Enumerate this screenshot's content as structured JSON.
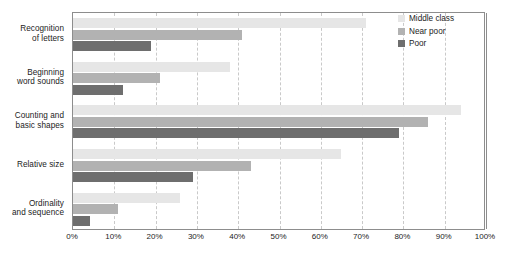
{
  "chart_data": {
    "type": "bar",
    "orientation": "horizontal",
    "title": "",
    "subtitle": "",
    "xlabel": "",
    "ylabel": "",
    "xlim": [
      0,
      100
    ],
    "xtick_labels": [
      "0%",
      "10%",
      "20%",
      "30%",
      "40%",
      "50%",
      "60%",
      "70%",
      "80%",
      "90%",
      "100%"
    ],
    "xtick_values": [
      0,
      10,
      20,
      30,
      40,
      50,
      60,
      70,
      80,
      90,
      100
    ],
    "grid": "vertical-dashed",
    "legend_position": "top-right",
    "categories": [
      "Recognition of letters",
      "Beginning word sounds",
      "Counting and basic shapes",
      "Relative size",
      "Ordinality and sequence"
    ],
    "category_lines": [
      [
        "Recognition",
        "of letters"
      ],
      [
        "Beginning",
        "word sounds"
      ],
      [
        "Counting and",
        "basic shapes"
      ],
      [
        "Relative size"
      ],
      [
        "Ordinality",
        "and sequence"
      ]
    ],
    "series": [
      {
        "name": "Middle class",
        "color": "#e6e6e6",
        "values": [
          71,
          38,
          94,
          65,
          26
        ]
      },
      {
        "name": "Near poor",
        "color": "#b2b2b2",
        "values": [
          41,
          21,
          86,
          43,
          11
        ]
      },
      {
        "name": "Poor",
        "color": "#6e6e6e",
        "values": [
          19,
          12,
          79,
          29,
          4
        ]
      }
    ]
  },
  "legend": {
    "items": [
      {
        "label": "Middle class",
        "color": "#e6e6e6"
      },
      {
        "label": "Near poor",
        "color": "#b2b2b2"
      },
      {
        "label": "Poor",
        "color": "#6e6e6e"
      }
    ]
  },
  "colors": {
    "middle_class": "#e6e6e6",
    "near_poor": "#b2b2b2",
    "poor": "#6e6e6e",
    "frame": "#8d8d8d",
    "gridline": "#c9c9c9",
    "text": "#1c1c1c",
    "background": "#ffffff"
  }
}
